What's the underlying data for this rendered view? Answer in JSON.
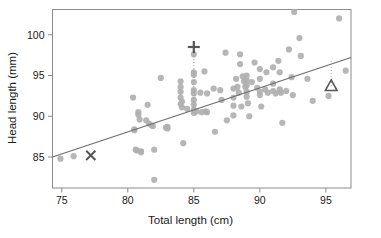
{
  "chart_data": {
    "type": "scatter",
    "title": "",
    "xlabel": "Total length (cm)",
    "ylabel": "Head length (mm)",
    "xlim": [
      74.3,
      96.9
    ],
    "ylim": [
      81.2,
      103.1
    ],
    "xticks": [
      75,
      80,
      85,
      90,
      95
    ],
    "yticks": [
      85,
      90,
      95,
      100
    ],
    "grid": false,
    "legend": "none",
    "point_color": "#b0b0b0",
    "line_color": "#6e6e6e",
    "marker_color": "#555555",
    "frame_color": "#8a8a8a",
    "points": [
      [
        74.9,
        84.8
      ],
      [
        75.9,
        85.1
      ],
      [
        80.4,
        92.3
      ],
      [
        80.5,
        88.4
      ],
      [
        80.5,
        88.3
      ],
      [
        80.6,
        85.9
      ],
      [
        80.7,
        85.8
      ],
      [
        80.8,
        90.5
      ],
      [
        80.8,
        90.2
      ],
      [
        80.9,
        89.6
      ],
      [
        81.0,
        85.7
      ],
      [
        81.0,
        85.6
      ],
      [
        81.4,
        89.5
      ],
      [
        81.5,
        91.4
      ],
      [
        81.6,
        89.1
      ],
      [
        81.8,
        88.9
      ],
      [
        81.9,
        88.8
      ],
      [
        82.0,
        85.9
      ],
      [
        82.0,
        82.2
      ],
      [
        82.5,
        94.7
      ],
      [
        82.9,
        88.6
      ],
      [
        83.0,
        88.5
      ],
      [
        83.0,
        88.7
      ],
      [
        84.0,
        91.5
      ],
      [
        84.0,
        92.3
      ],
      [
        84.0,
        93.0
      ],
      [
        84.0,
        93.6
      ],
      [
        84.0,
        94.3
      ],
      [
        84.1,
        91.1
      ],
      [
        84.1,
        91.8
      ],
      [
        84.2,
        86.7
      ],
      [
        84.5,
        90.9
      ],
      [
        85.0,
        97.6
      ],
      [
        85.0,
        95.4
      ],
      [
        85.0,
        95.1
      ],
      [
        85.0,
        94.2
      ],
      [
        85.0,
        93.2
      ],
      [
        85.0,
        92.8
      ],
      [
        85.0,
        92.0
      ],
      [
        85.0,
        91.4
      ],
      [
        85.0,
        90.8
      ],
      [
        85.0,
        90.4
      ],
      [
        85.2,
        90.6
      ],
      [
        85.5,
        92.9
      ],
      [
        85.6,
        90.5
      ],
      [
        85.8,
        95.5
      ],
      [
        85.9,
        90.6
      ],
      [
        86.0,
        92.8
      ],
      [
        86.0,
        90.5
      ],
      [
        86.5,
        93.4
      ],
      [
        86.6,
        88.1
      ],
      [
        87.0,
        93.2
      ],
      [
        87.1,
        92.0
      ],
      [
        87.4,
        97.8
      ],
      [
        87.5,
        89.5
      ],
      [
        88.0,
        93.4
      ],
      [
        88.0,
        92.3
      ],
      [
        88.0,
        91.3
      ],
      [
        88.0,
        90.1
      ],
      [
        88.2,
        94.6
      ],
      [
        88.3,
        93.6
      ],
      [
        88.4,
        92.9
      ],
      [
        88.5,
        97.6
      ],
      [
        88.5,
        96.4
      ],
      [
        88.6,
        91.2
      ],
      [
        88.7,
        94.9
      ],
      [
        88.8,
        94.3
      ],
      [
        88.9,
        93.6
      ],
      [
        89.0,
        95.0
      ],
      [
        89.0,
        94.4
      ],
      [
        89.0,
        93.8
      ],
      [
        89.0,
        93.0
      ],
      [
        89.0,
        92.4
      ],
      [
        89.1,
        91.6
      ],
      [
        89.2,
        90.0
      ],
      [
        89.4,
        94.2
      ],
      [
        89.6,
        96.6
      ],
      [
        89.8,
        93.5
      ],
      [
        90.0,
        95.8
      ],
      [
        90.0,
        94.6
      ],
      [
        90.0,
        93.0
      ],
      [
        90.0,
        92.6
      ],
      [
        90.1,
        91.2
      ],
      [
        90.4,
        93.3
      ],
      [
        90.5,
        95.4
      ],
      [
        90.6,
        92.9
      ],
      [
        91.0,
        96.0
      ],
      [
        91.0,
        94.0
      ],
      [
        91.0,
        93.1
      ],
      [
        91.2,
        92.8
      ],
      [
        91.4,
        96.8
      ],
      [
        91.5,
        95.4
      ],
      [
        91.5,
        93.3
      ],
      [
        91.6,
        92.9
      ],
      [
        91.7,
        89.2
      ],
      [
        92.0,
        93.1
      ],
      [
        92.2,
        98.2
      ],
      [
        92.4,
        94.8
      ],
      [
        92.5,
        92.6
      ],
      [
        92.6,
        102.8
      ],
      [
        93.0,
        99.6
      ],
      [
        93.1,
        97.4
      ],
      [
        93.6,
        94.6
      ],
      [
        94.0,
        91.9
      ],
      [
        95.2,
        92.5
      ],
      [
        96.0,
        102.0
      ],
      [
        96.5,
        95.6
      ]
    ],
    "regression_line": {
      "x1": 74.3,
      "y1": 85.0,
      "x2": 96.9,
      "y2": 97.2
    },
    "highlighted": [
      {
        "name": "plus-marker",
        "glyph": "plus",
        "x": 85.0,
        "y": 98.5,
        "leader_to_y": 90.4
      },
      {
        "name": "x-marker",
        "glyph": "x",
        "x": 77.2,
        "y": 85.2
      },
      {
        "name": "triangle-marker",
        "glyph": "triangle",
        "x": 95.4,
        "y": 93.7,
        "leader_to_y": 97.0
      }
    ]
  }
}
